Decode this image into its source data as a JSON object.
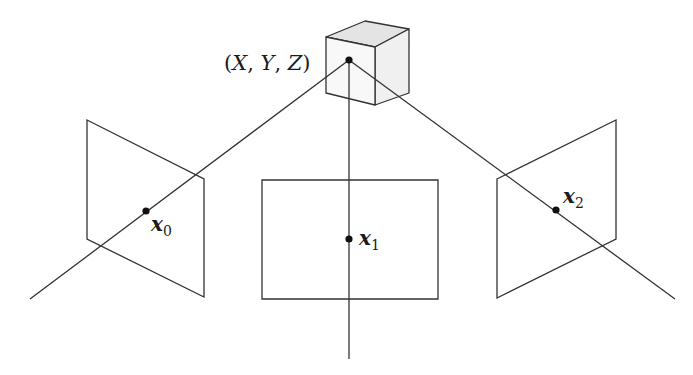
{
  "diagram": {
    "colors": {
      "line": "#333333",
      "plane_fill": "#ffffff",
      "cube_top": "#e6e6e6",
      "cube_front": "#f7f7f7",
      "cube_side": "#efefef",
      "point": "#111111"
    },
    "world_point": {
      "label": "(X, Y, Z)",
      "open": "(",
      "x": "X",
      "sep1": ", ",
      "y": "Y",
      "sep2": ", ",
      "z": "Z",
      "close": ")",
      "position": [
        349,
        60
      ]
    },
    "cube": {
      "front": [
        [
          326,
          37
        ],
        [
          375,
          47
        ],
        [
          375,
          105
        ],
        [
          326,
          93
        ]
      ],
      "top": [
        [
          326,
          37
        ],
        [
          365,
          21
        ],
        [
          409,
          29
        ],
        [
          375,
          47
        ]
      ],
      "side": [
        [
          375,
          47
        ],
        [
          409,
          29
        ],
        [
          409,
          93
        ],
        [
          375,
          105
        ]
      ]
    },
    "image_planes": [
      {
        "name": "left-camera-plane",
        "corners": [
          [
            87,
            120
          ],
          [
            204,
            179
          ],
          [
            204,
            297
          ],
          [
            87,
            239
          ]
        ],
        "point": [
          146,
          211
        ],
        "label": "x",
        "subscript": "0",
        "ray_end": [
          30,
          299
        ]
      },
      {
        "name": "center-camera-plane",
        "corners": [
          [
            262,
            180
          ],
          [
            438,
            180
          ],
          [
            438,
            299
          ],
          [
            262,
            299
          ]
        ],
        "point": [
          349,
          239
        ],
        "label": "x",
        "subscript": "1",
        "ray_end": [
          349,
          359
        ]
      },
      {
        "name": "right-camera-plane",
        "corners": [
          [
            497,
            179
          ],
          [
            616,
            120
          ],
          [
            616,
            239
          ],
          [
            497,
            298
          ]
        ],
        "point": [
          556,
          210
        ],
        "label": "x",
        "subscript": "2",
        "ray_end": [
          675,
          299
        ]
      }
    ]
  }
}
